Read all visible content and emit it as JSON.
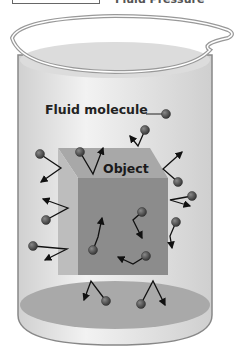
{
  "header": {
    "partial_title": "Fluid Pressure"
  },
  "labels": {
    "fluid_molecule": "Fluid molecule",
    "object": "Object"
  },
  "colors": {
    "fluid": "#d8d8d8",
    "object_front": "#8a8a8a",
    "object_top": "#a6a6a6",
    "object_side": "#b8b8b8",
    "molecule": "#4a4a4a",
    "beaker_floor": "#a9a9a9"
  },
  "molecules": [
    {
      "x": 166,
      "y": 114
    },
    {
      "x": 145,
      "y": 130
    },
    {
      "x": 40,
      "y": 154
    },
    {
      "x": 80,
      "y": 152
    },
    {
      "x": 178,
      "y": 182
    },
    {
      "x": 46,
      "y": 220
    },
    {
      "x": 192,
      "y": 196
    },
    {
      "x": 176,
      "y": 222
    },
    {
      "x": 142,
      "y": 212
    },
    {
      "x": 93,
      "y": 250
    },
    {
      "x": 33,
      "y": 246
    },
    {
      "x": 146,
      "y": 256
    },
    {
      "x": 106,
      "y": 301
    },
    {
      "x": 141,
      "y": 304
    }
  ]
}
